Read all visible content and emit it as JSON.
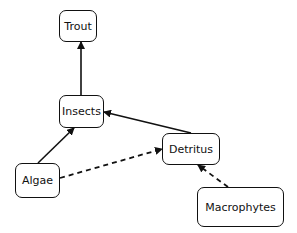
{
  "diagram": {
    "type": "food-web",
    "nodes": [
      {
        "id": "trout",
        "label": "Trout",
        "x": 59,
        "y": 10,
        "w": 38,
        "h": 32
      },
      {
        "id": "insects",
        "label": "Insects",
        "x": 59,
        "y": 95,
        "w": 45,
        "h": 33
      },
      {
        "id": "algae",
        "label": "Algae",
        "x": 15,
        "y": 163,
        "w": 45,
        "h": 35
      },
      {
        "id": "detritus",
        "label": "Detritus",
        "x": 162,
        "y": 133,
        "w": 58,
        "h": 32
      },
      {
        "id": "macrophytes",
        "label": "Macrophytes",
        "x": 197,
        "y": 187,
        "w": 87,
        "h": 40
      }
    ],
    "edges": [
      {
        "from": "insects",
        "to": "trout",
        "style": "solid",
        "x1": 81,
        "y1": 95,
        "x2": 81,
        "y2": 42
      },
      {
        "from": "algae",
        "to": "insects",
        "style": "solid",
        "x1": 38,
        "y1": 163,
        "x2": 74,
        "y2": 128
      },
      {
        "from": "detritus",
        "to": "insects",
        "style": "solid",
        "x1": 191,
        "y1": 133,
        "x2": 104,
        "y2": 112
      },
      {
        "from": "algae",
        "to": "detritus",
        "style": "dashed",
        "x1": 60,
        "y1": 178,
        "x2": 162,
        "y2": 149
      },
      {
        "from": "macrophytes",
        "to": "detritus",
        "style": "dashed",
        "x1": 228,
        "y1": 187,
        "x2": 198,
        "y2": 165
      }
    ],
    "colors": {
      "stroke": "#111111",
      "background": "#ffffff"
    }
  }
}
